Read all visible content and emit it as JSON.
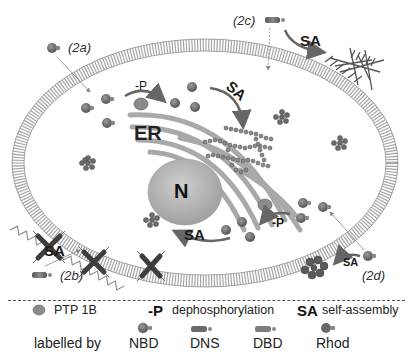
{
  "diagram": {
    "compartments": {
      "er_label": "ER",
      "nucleus_label": "N"
    },
    "pathways": [
      {
        "id": "2a",
        "label": "(2a)",
        "probe": "NBD",
        "process": "-P"
      },
      {
        "id": "2b",
        "label": "(2b)",
        "probe": "DNS",
        "process": "SA"
      },
      {
        "id": "2c",
        "label": "(2c)",
        "probe": "DBD",
        "process": "SA"
      },
      {
        "id": "2d",
        "label": "(2d)",
        "probe": "Rhod",
        "process": "SA"
      }
    ],
    "arrow_labels": {
      "dephos_top": "-P",
      "sa_er": "SA",
      "sa_2c": "SA",
      "sa_2b": "SA",
      "sa_bottom": "SA",
      "dephos_bottom": "-P",
      "sa_2d": "SA"
    },
    "colors": {
      "membrane": "#9a9a9a",
      "er": "#a8a8a8",
      "nucleus": "#b5b5b5",
      "molecule": "#6e6e6e",
      "assembly": "#555555",
      "text": "#1a1a1a"
    }
  },
  "legend": {
    "row1": [
      {
        "icon": "ptp1b-enzyme-icon",
        "text": "PTP 1B"
      },
      {
        "key": "-P",
        "text": "dephosphorylation"
      },
      {
        "key": "SA",
        "text": "self-assembly"
      }
    ],
    "labelled_by": "labelled by",
    "probes": [
      {
        "icon": "nbd-probe-icon",
        "name": "NBD"
      },
      {
        "icon": "dns-probe-icon",
        "name": "DNS"
      },
      {
        "icon": "dbd-probe-icon",
        "name": "DBD"
      },
      {
        "icon": "rhod-probe-icon",
        "name": "Rhod"
      }
    ]
  }
}
